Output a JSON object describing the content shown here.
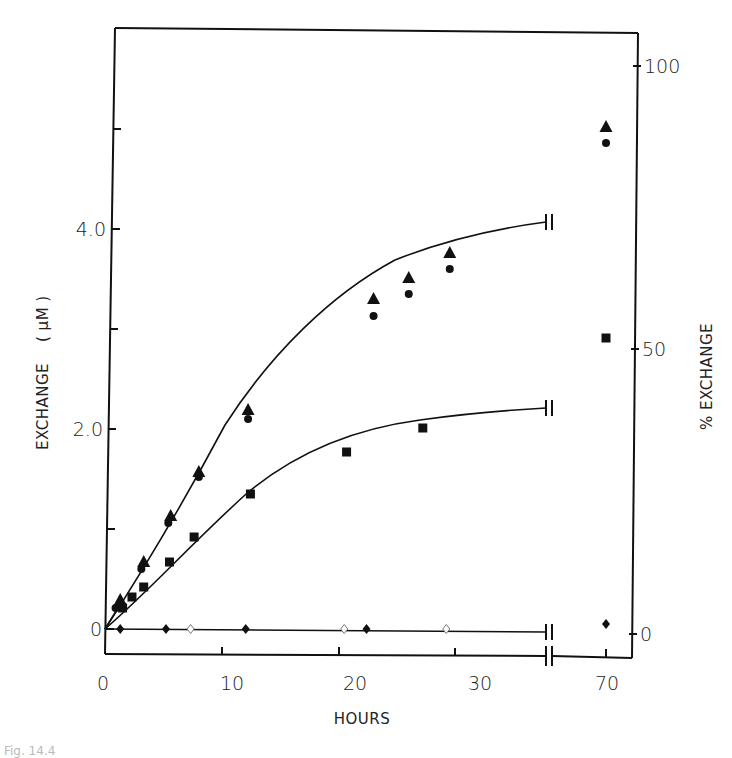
{
  "chart_data": {
    "type": "scatter",
    "title": "",
    "xlabel": "HOURS",
    "ylabel": "EXCHANGE (µM)",
    "ylabel_right": "% EXCHANGE",
    "x_ticks": [
      "0",
      "10",
      "20",
      "30",
      "70"
    ],
    "y_ticks_left": [
      "0",
      "2.0",
      "4.0"
    ],
    "y_ticks_right": [
      "0",
      "50",
      "100"
    ],
    "xlim": [
      0,
      35,
      "break",
      70
    ],
    "ylim_left": [
      -0.25,
      6.0
    ],
    "ylim_right": [
      0,
      100
    ],
    "x_axis_break": true,
    "grid": false,
    "legend": "none",
    "series": [
      {
        "name": "triangles (filled)",
        "marker": "triangle",
        "points": [
          [
            1.3,
            0.29
          ],
          [
            3.3,
            0.67
          ],
          [
            5.6,
            1.13
          ],
          [
            8.0,
            1.57
          ],
          [
            12.2,
            2.19
          ],
          [
            22.9,
            3.3
          ],
          [
            25.9,
            3.51
          ],
          [
            29.4,
            3.76
          ],
          [
            70,
            5.02
          ]
        ]
      },
      {
        "name": "circles (filled)",
        "marker": "circle",
        "points": [
          [
            0.9,
            0.21
          ],
          [
            3.1,
            0.6
          ],
          [
            5.4,
            1.06
          ],
          [
            8.0,
            1.52
          ],
          [
            12.2,
            2.1
          ],
          [
            22.9,
            3.13
          ],
          [
            25.9,
            3.35
          ],
          [
            29.4,
            3.6
          ],
          [
            70,
            4.86
          ]
        ]
      },
      {
        "name": "squares (filled)",
        "marker": "square",
        "points": [
          [
            1.5,
            0.21
          ],
          [
            2.3,
            0.32
          ],
          [
            3.3,
            0.42
          ],
          [
            5.5,
            0.67
          ],
          [
            7.6,
            0.92
          ],
          [
            12.4,
            1.35
          ],
          [
            20.6,
            1.77
          ],
          [
            27.1,
            2.01
          ],
          [
            70,
            2.91
          ]
        ]
      },
      {
        "name": "diamonds (filled)",
        "marker": "diamond",
        "points": [
          [
            1.3,
            0.0
          ],
          [
            5.2,
            0.0
          ],
          [
            12.0,
            0.0
          ],
          [
            22.3,
            0.0
          ],
          [
            70,
            0.05
          ]
        ]
      },
      {
        "name": "diamonds (open)",
        "marker": "diamond-open",
        "points": [
          [
            7.3,
            0.0
          ],
          [
            20.4,
            0.0
          ],
          [
            29.1,
            0.0
          ]
        ]
      }
    ],
    "fit_curves": [
      {
        "name": "upper curve (triangles/circles)",
        "points": [
          [
            0,
            0
          ],
          [
            2,
            0.42
          ],
          [
            5,
            1.03
          ],
          [
            8,
            1.56
          ],
          [
            12,
            2.17
          ],
          [
            16,
            2.67
          ],
          [
            20,
            3.08
          ],
          [
            25,
            3.5
          ],
          [
            30,
            3.81
          ],
          [
            35,
            4.07
          ]
        ]
      },
      {
        "name": "middle curve (squares)",
        "points": [
          [
            0,
            0
          ],
          [
            2,
            0.29
          ],
          [
            5,
            0.68
          ],
          [
            8,
            0.97
          ],
          [
            12,
            1.33
          ],
          [
            16,
            1.59
          ],
          [
            20,
            1.79
          ],
          [
            25,
            1.98
          ],
          [
            30,
            2.12
          ],
          [
            35,
            2.21
          ]
        ]
      },
      {
        "name": "baseline (diamonds)",
        "points": [
          [
            0,
            0
          ],
          [
            35,
            -0.03
          ]
        ]
      }
    ]
  },
  "labels": {
    "xlabel": "HOURS",
    "ylabel_left": "EXCHANGE",
    "ylabel_left_unit": "( µM )",
    "ylabel_right": "% EXCHANGE",
    "x_ticks": [
      "0",
      "10",
      "20",
      "30",
      "70"
    ],
    "y_ticks_left": [
      "0",
      "2.0",
      "4.0"
    ],
    "y_ticks_right": [
      "0",
      "50",
      "100"
    ]
  },
  "caption_fragment": "Fig. 14.4"
}
